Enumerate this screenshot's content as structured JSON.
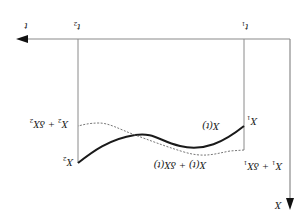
{
  "figure": {
    "orientation": "rotated-180",
    "axes": {
      "horizontal": {
        "label": "t",
        "arrow_direction": "left"
      },
      "vertical": {
        "label": "X",
        "arrow_direction": "down"
      }
    },
    "markers": [
      {
        "id": "t1",
        "label": "t",
        "subscript": "1"
      },
      {
        "id": "t2",
        "label": "t",
        "subscript": "2"
      }
    ],
    "curves": [
      {
        "id": "nominal",
        "label": "X(t)",
        "style": "solid"
      },
      {
        "id": "varied",
        "label": "X(t) + δX(t)",
        "style": "dotted"
      }
    ],
    "endpoint_labels": {
      "x1": {
        "base": "X",
        "subscript": "1"
      },
      "x2": {
        "base": "X",
        "subscript": "2"
      },
      "x1_varied": {
        "text": "X",
        "sub1": "1",
        "mid": " + δX",
        "sub2": "1"
      },
      "x2_varied": {
        "text": "X",
        "sub1": "2",
        "mid": " + δX",
        "sub2": "2"
      }
    },
    "colors": {
      "axis": "#7a7a7a",
      "curve": "#1a1a1a",
      "dotted": "#777777",
      "arrow": "#111111"
    }
  }
}
